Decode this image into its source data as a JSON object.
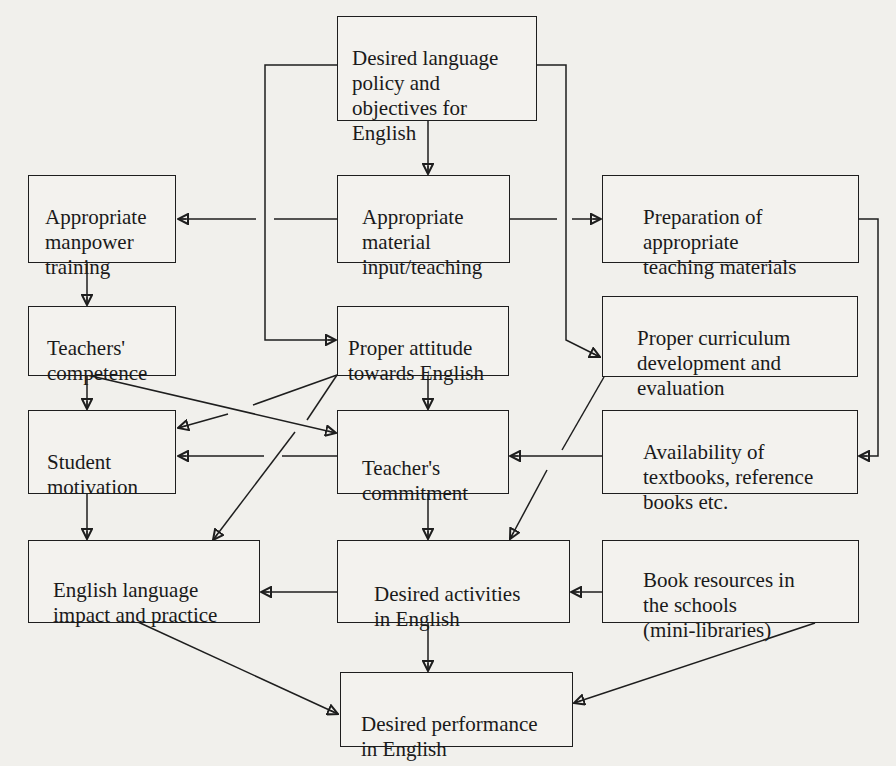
{
  "diagram": {
    "type": "flowchart",
    "boxes": {
      "policy": "Desired language\npolicy and\nobjectives for\nEnglish",
      "manpower": "Appropriate\nmanpower\ntraining",
      "material": "Appropriate\nmaterial\ninput/teaching",
      "preparation": "Preparation of\nappropriate\nteaching materials",
      "competence": "Teachers'\ncompetence",
      "attitude": "Proper attitude\ntowards English",
      "curriculum": "Proper curriculum\ndevelopment and\nevaluation",
      "motivation": "Student\nmotivation",
      "commitment": "Teacher's\ncommitment",
      "availability": "Availability of\ntextbooks, reference\nbooks etc.",
      "impact": "English language\nimpact and practice",
      "activities": "Desired activities\nin English",
      "resources": "Book resources in\nthe schools\n(mini-libraries)",
      "performance": "Desired performance\nin English"
    },
    "edges": [
      {
        "from": "policy",
        "to": "material"
      },
      {
        "from": "policy",
        "to": "attitude"
      },
      {
        "from": "policy",
        "to": "curriculum"
      },
      {
        "from": "material",
        "to": "manpower"
      },
      {
        "from": "material",
        "to": "preparation"
      },
      {
        "from": "manpower",
        "to": "competence"
      },
      {
        "from": "competence",
        "to": "motivation"
      },
      {
        "from": "competence",
        "to": "commitment"
      },
      {
        "from": "attitude",
        "to": "commitment"
      },
      {
        "from": "attitude",
        "to": "motivation"
      },
      {
        "from": "attitude",
        "to": "impact"
      },
      {
        "from": "commitment",
        "to": "motivation"
      },
      {
        "from": "commitment",
        "to": "activities"
      },
      {
        "from": "preparation",
        "to": "availability"
      },
      {
        "from": "availability",
        "to": "commitment"
      },
      {
        "from": "curriculum",
        "to": "activities"
      },
      {
        "from": "motivation",
        "to": "impact"
      },
      {
        "from": "activities",
        "to": "impact"
      },
      {
        "from": "activities",
        "to": "performance"
      },
      {
        "from": "resources",
        "to": "activities"
      },
      {
        "from": "impact",
        "to": "performance"
      },
      {
        "from": "resources",
        "to": "performance"
      }
    ]
  }
}
